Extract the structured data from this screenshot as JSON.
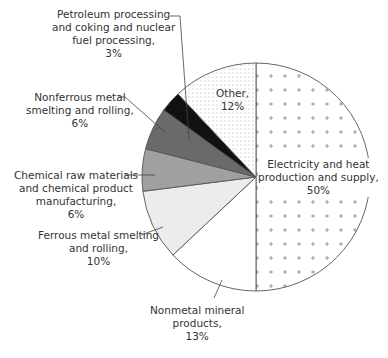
{
  "chart_data": {
    "type": "pie",
    "title": "",
    "start_angle_deg": 0,
    "direction": "clockwise",
    "slices": [
      {
        "label": "Electricity and heat production and supply",
        "value": 50,
        "display": "Electricity and heat production and supply, 50%",
        "fill": "#ffffff",
        "pattern": "plus"
      },
      {
        "label": "Nonmetal mineral products",
        "value": 13,
        "display": "Nonmetal mineral products, 13%",
        "fill": "#ffffff",
        "pattern": "none"
      },
      {
        "label": "Ferrous metal smelting and rolling",
        "value": 10,
        "display": "Ferrous metal smelting and rolling, 10%",
        "fill": "#ececec",
        "pattern": "none"
      },
      {
        "label": "Chemical raw materials and chemical product manufacturing",
        "value": 6,
        "display": "Chemical raw materials and chemical product manufacturing, 6%",
        "fill": "#a0a0a0",
        "pattern": "none"
      },
      {
        "label": "Nonferrous metal smelting and rolling",
        "value": 6,
        "display": "Nonferrous metal smelting and rolling, 6%",
        "fill": "#6a6a6a",
        "pattern": "none"
      },
      {
        "label": "Petroleum processing and coking and nuclear fuel processing",
        "value": 3,
        "display": "Petroleum processing and coking and nuclear fuel processing, 3%",
        "fill": "#111111",
        "pattern": "none"
      },
      {
        "label": "Other",
        "value": 12,
        "display": "Other, 12%",
        "fill": "#ffffff",
        "pattern": "dots"
      }
    ],
    "legend": null
  },
  "labels": {
    "petroleum": [
      "Petroleum processing",
      "and coking and nuclear",
      "fuel processing,",
      "3%"
    ],
    "nonferrous": [
      "Nonferrous metal",
      "smelting and rolling,",
      "6%"
    ],
    "chemical": [
      "Chemical raw materials",
      "and chemical product",
      "manufacturing,",
      "6%"
    ],
    "ferrous": [
      "Ferrous metal smelting",
      "and rolling,",
      "10%"
    ],
    "nonmetal": [
      "Nonmetal mineral",
      "products,",
      "13%"
    ],
    "other": [
      "Other,",
      "12%"
    ],
    "electricity": [
      "Electricity and heat",
      "production and supply,",
      "50%"
    ]
  }
}
